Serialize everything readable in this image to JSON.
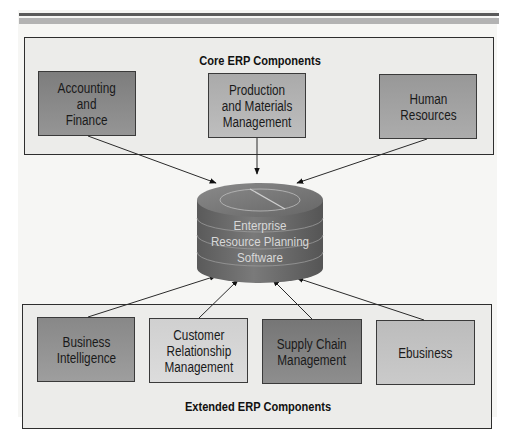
{
  "diagram": {
    "title": "ERP Components",
    "core_group": {
      "title": "Core ERP Components",
      "components": [
        {
          "label": "Accounting\nand\nFinance",
          "color": "#8a8a8a"
        },
        {
          "label": "Production\nand Materials\nManagement",
          "color": "#b4b4b4"
        },
        {
          "label": "Human\nResources",
          "color": "#a2a2a2"
        }
      ]
    },
    "center": {
      "label": "Enterprise\nResource Planning\nSoftware",
      "shape": "database-cylinder",
      "color": "#6e6e6e"
    },
    "extended_group": {
      "title": "Extended ERP Components",
      "components": [
        {
          "label": "Business\nIntelligence",
          "color": "#939393"
        },
        {
          "label": "Customer\nRelationship\nManagement",
          "color": "#d6d6d6"
        },
        {
          "label": "Supply Chain\nManagement",
          "color": "#828282"
        },
        {
          "label": "Ebusiness",
          "color": "#c4c4c4"
        }
      ]
    },
    "edges": [
      {
        "from": "Accounting and Finance",
        "to": "Enterprise Resource Planning Software"
      },
      {
        "from": "Production and Materials Management",
        "to": "Enterprise Resource Planning Software"
      },
      {
        "from": "Human Resources",
        "to": "Enterprise Resource Planning Software"
      },
      {
        "from": "Business Intelligence",
        "to": "Enterprise Resource Planning Software"
      },
      {
        "from": "Customer Relationship Management",
        "to": "Enterprise Resource Planning Software"
      },
      {
        "from": "Supply Chain Management",
        "to": "Enterprise Resource Planning Software"
      },
      {
        "from": "Ebusiness",
        "to": "Enterprise Resource Planning Software"
      }
    ]
  }
}
